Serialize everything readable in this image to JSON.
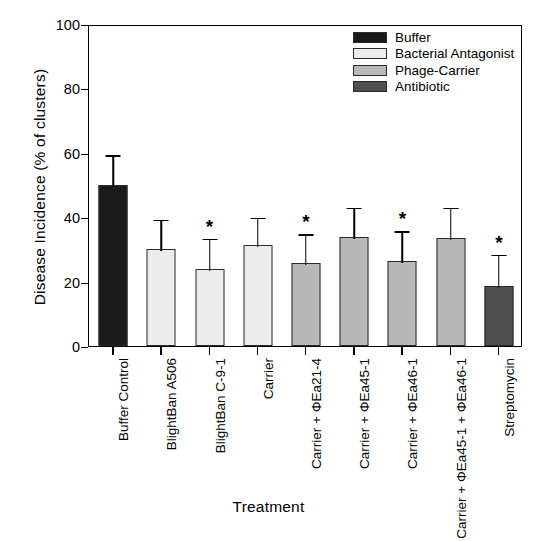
{
  "chart_data": {
    "type": "bar",
    "title": "",
    "xlabel": "Treatment",
    "ylabel": "Disease Incidence (% of clusters)",
    "ylim": [
      0,
      100
    ],
    "yticks": [
      0,
      20,
      40,
      60,
      80,
      100
    ],
    "grid": false,
    "legend_position": "top-right",
    "categories": [
      "Buffer Control",
      "BlightBan A506",
      "BlightBan C-9-1",
      "Carrier",
      "Carrier + ΦEa21-4",
      "Carrier + ΦEa45-1",
      "Carrier + ΦEa46-1",
      "Carrier + ΦEa45-1 + ΦEa46-1",
      "Streptomycin"
    ],
    "values": [
      50.0,
      30.2,
      23.8,
      31.5,
      25.8,
      33.9,
      26.5,
      33.4,
      18.5
    ],
    "errors": [
      9.8,
      9.6,
      10.2,
      9.0,
      9.5,
      9.6,
      9.8,
      10.2,
      10.5
    ],
    "error_upper": [
      59.8,
      39.8,
      34.0,
      40.5,
      35.3,
      43.5,
      36.3,
      43.6,
      29.0
    ],
    "significance": [
      "",
      "",
      "*",
      "",
      "*",
      "",
      "*",
      "",
      "*"
    ],
    "group_of_bar": [
      "Buffer",
      "Bacterial Antagonist",
      "Bacterial Antagonist",
      "Bacterial Antagonist",
      "Phage-Carrier",
      "Phage-Carrier",
      "Phage-Carrier",
      "Phage-Carrier",
      "Antibiotic"
    ],
    "bar_colors": [
      "#1a1a1a",
      "#ececec",
      "#ececec",
      "#ececec",
      "#b8b8b8",
      "#b8b8b8",
      "#b8b8b8",
      "#b8b8b8",
      "#4f4f4f"
    ],
    "legend": [
      {
        "label": "Buffer",
        "color": "#1a1a1a"
      },
      {
        "label": "Bacterial Antagonist",
        "color": "#ececec"
      },
      {
        "label": "Phage-Carrier",
        "color": "#b8b8b8"
      },
      {
        "label": "Antibiotic",
        "color": "#4f4f4f"
      }
    ],
    "significance_note": "* denotes significant difference"
  }
}
